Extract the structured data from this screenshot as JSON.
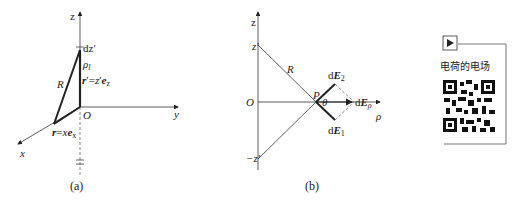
{
  "figure_a": {
    "caption": "(a)",
    "axes": {
      "z": "z",
      "y": "y",
      "x": "x",
      "origin": "O"
    },
    "labels": {
      "dz": "dz′",
      "rho_l": "ρl",
      "r_prime": "r′=z′ez",
      "R": "R",
      "r": "r=xex"
    }
  },
  "figure_b": {
    "caption": "(b)",
    "axes": {
      "z": "z",
      "rho": "ρ",
      "origin": "O"
    },
    "labels": {
      "z_top": "z′",
      "z_bottom": "−z′",
      "R": "R",
      "P": "P",
      "theta": "θ",
      "dE2": "dE2",
      "dE1": "dE1",
      "dErho": "dEρ"
    }
  },
  "qr_card": {
    "play_icon": "play-icon",
    "title": "电荷的电场"
  }
}
